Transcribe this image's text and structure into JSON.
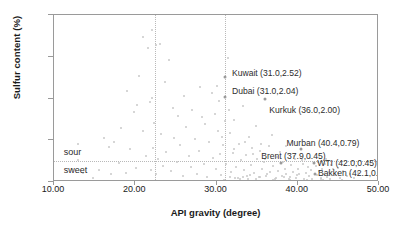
{
  "chart_data": {
    "type": "scatter",
    "title": "",
    "xlabel": "API gravity (degree)",
    "ylabel": "Sulfur content (%)",
    "xlim": [
      10.0,
      50.0
    ],
    "ylim": [
      0.0,
      4.0
    ],
    "xticks": [
      "10.00",
      "20.00",
      "30.00",
      "40.00",
      "50.00"
    ],
    "xtick_values": [
      10,
      20,
      30,
      40,
      50
    ],
    "yticks": [
      "0.00",
      "1.00",
      "2.00",
      "3.00",
      "4.00"
    ],
    "ytick_values": [
      0,
      1,
      2,
      3,
      4
    ],
    "grid": false,
    "legend": "none",
    "category_bands": [
      {
        "label": "heavy",
        "x_center": 25.0
      },
      {
        "label": "medium",
        "x_center": 31.1
      },
      {
        "label": "light",
        "x_center": 37.0
      }
    ],
    "vertical_dividers": [
      22.4,
      31.1
    ],
    "horizontal_divider": 0.5,
    "quality_labels": [
      {
        "label": "sour",
        "x": 11.2,
        "y": 0.72
      },
      {
        "label": "sweet",
        "x": 11.2,
        "y": 0.28
      }
    ],
    "annotations": [
      {
        "name": "Kuwait",
        "text": "Kuwait (31.0,2.52)",
        "x": 31.0,
        "y": 2.52,
        "label_x": 31.9,
        "label_y": 2.62
      },
      {
        "name": "Dubai",
        "text": "Dubai (31.0,2.04)",
        "x": 31.0,
        "y": 2.04,
        "label_x": 31.9,
        "label_y": 2.17
      },
      {
        "name": "Kurkuk",
        "text": "Kurkuk (36.0,2.00)",
        "x": 36.0,
        "y": 2.0,
        "label_x": 36.5,
        "label_y": 1.72
      },
      {
        "name": "Murban",
        "text": "Murban (40.4,0.79)",
        "x": 40.4,
        "y": 0.79,
        "label_x": 38.6,
        "label_y": 0.93
      },
      {
        "name": "Brent",
        "text": "Brent (37.9,0.45)",
        "x": 37.9,
        "y": 0.45,
        "label_x": 35.5,
        "label_y": 0.63
      },
      {
        "name": "WTI",
        "text": "WTI (42.0,0.45)",
        "x": 42.0,
        "y": 0.45,
        "label_x": 42.4,
        "label_y": 0.45
      },
      {
        "name": "Bakken",
        "text": "Bakken (42.1,0.18)",
        "x": 42.1,
        "y": 0.18,
        "label_x": 42.5,
        "label_y": 0.22
      }
    ],
    "points": [
      [
        12.9,
        0.92
      ],
      [
        13.6,
        0.21
      ],
      [
        14.8,
        0.1
      ],
      [
        16.2,
        1.05
      ],
      [
        16.8,
        0.84
      ],
      [
        17.4,
        0.95
      ],
      [
        18.0,
        0.45
      ],
      [
        18.3,
        1.3
      ],
      [
        18.9,
        0.22
      ],
      [
        19.3,
        0.78
      ],
      [
        19.8,
        1.68
      ],
      [
        20.1,
        0.33
      ],
      [
        20.5,
        2.55
      ],
      [
        20.9,
        1.22
      ],
      [
        21.0,
        3.48
      ],
      [
        21.3,
        0.63
      ],
      [
        21.6,
        3.22
      ],
      [
        21.8,
        1.92
      ],
      [
        21.9,
        0.28
      ],
      [
        22.0,
        2.02
      ],
      [
        22.1,
        3.64
      ],
      [
        22.2,
        0.82
      ],
      [
        22.3,
        1.41
      ],
      [
        22.5,
        3.28
      ],
      [
        22.6,
        0.18
      ],
      [
        22.8,
        0.55
      ],
      [
        23.0,
        3.3
      ],
      [
        23.2,
        1.15
      ],
      [
        23.4,
        0.38
      ],
      [
        23.8,
        0.72
      ],
      [
        24.1,
        2.92
      ],
      [
        24.4,
        0.27
      ],
      [
        24.8,
        1.05
      ],
      [
        25.1,
        0.48
      ],
      [
        25.5,
        0.88
      ],
      [
        25.9,
        0.15
      ],
      [
        26.2,
        1.32
      ],
      [
        26.6,
        0.62
      ],
      [
        26.9,
        0.35
      ],
      [
        27.3,
        1.02
      ],
      [
        27.6,
        0.2
      ],
      [
        27.9,
        0.74
      ],
      [
        28.2,
        1.55
      ],
      [
        28.5,
        0.42
      ],
      [
        28.8,
        0.12
      ],
      [
        29.1,
        0.95
      ],
      [
        29.4,
        2.12
      ],
      [
        29.6,
        0.58
      ],
      [
        29.9,
        0.3
      ],
      [
        30.2,
        1.22
      ],
      [
        30.4,
        0.68
      ],
      [
        30.6,
        0.16
      ],
      [
        30.8,
        0.88
      ],
      [
        31.2,
        0.44
      ],
      [
        31.4,
        2.98
      ],
      [
        31.6,
        1.18
      ],
      [
        31.8,
        0.25
      ],
      [
        32.0,
        0.7
      ],
      [
        32.2,
        1.48
      ],
      [
        32.4,
        0.35
      ],
      [
        32.6,
        0.09
      ],
      [
        32.8,
        0.92
      ],
      [
        33.0,
        0.52
      ],
      [
        33.2,
        1.82
      ],
      [
        33.4,
        0.28
      ],
      [
        33.6,
        0.64
      ],
      [
        33.8,
        0.14
      ],
      [
        34.0,
        1.08
      ],
      [
        34.2,
        0.4
      ],
      [
        34.4,
        0.82
      ],
      [
        34.6,
        0.22
      ],
      [
        34.8,
        1.35
      ],
      [
        35.0,
        0.56
      ],
      [
        35.2,
        0.11
      ],
      [
        35.4,
        0.74
      ],
      [
        35.6,
        0.32
      ],
      [
        35.8,
        0.48
      ],
      [
        36.2,
        0.18
      ],
      [
        36.4,
        0.86
      ],
      [
        36.6,
        0.24
      ],
      [
        36.8,
        1.12
      ],
      [
        37.0,
        0.38
      ],
      [
        37.2,
        0.08
      ],
      [
        37.4,
        0.6
      ],
      [
        37.6,
        0.26
      ],
      [
        38.0,
        0.15
      ],
      [
        38.2,
        0.48
      ],
      [
        38.4,
        0.32
      ],
      [
        38.6,
        0.2
      ],
      [
        38.8,
        0.66
      ],
      [
        39.0,
        0.12
      ],
      [
        39.2,
        0.4
      ],
      [
        39.4,
        0.25
      ],
      [
        39.6,
        0.55
      ],
      [
        39.8,
        0.1
      ],
      [
        40.0,
        0.3
      ],
      [
        40.2,
        0.18
      ],
      [
        40.6,
        0.44
      ],
      [
        40.8,
        0.08
      ],
      [
        41.0,
        0.22
      ],
      [
        41.2,
        0.35
      ],
      [
        41.4,
        0.14
      ],
      [
        41.6,
        0.28
      ],
      [
        41.8,
        0.06
      ],
      [
        42.2,
        0.38
      ],
      [
        42.4,
        0.16
      ],
      [
        42.6,
        0.26
      ],
      [
        42.8,
        0.1
      ],
      [
        43.0,
        0.32
      ],
      [
        43.2,
        0.2
      ],
      [
        43.4,
        0.44
      ],
      [
        43.6,
        0.12
      ],
      [
        43.8,
        0.24
      ],
      [
        44.0,
        0.08
      ],
      [
        44.3,
        0.3
      ],
      [
        44.6,
        0.16
      ],
      [
        44.9,
        0.22
      ],
      [
        45.2,
        0.1
      ],
      [
        45.6,
        0.26
      ],
      [
        46.0,
        0.14
      ],
      [
        46.4,
        0.18
      ],
      [
        46.9,
        0.09
      ],
      [
        47.4,
        0.21
      ],
      [
        30.0,
        2.3
      ],
      [
        30.3,
        1.95
      ],
      [
        29.8,
        1.62
      ],
      [
        31.0,
        1.45
      ],
      [
        31.5,
        1.72
      ],
      [
        30.7,
        1.08
      ],
      [
        32.1,
        0.78
      ],
      [
        33.5,
        0.96
      ],
      [
        34.5,
        0.68
      ],
      [
        35.5,
        0.92
      ],
      [
        36.0,
        0.55
      ],
      [
        37.8,
        0.72
      ],
      [
        38.5,
        0.86
      ],
      [
        39.5,
        0.62
      ],
      [
        40.5,
        0.52
      ],
      [
        41.5,
        0.58
      ],
      [
        42.5,
        0.48
      ],
      [
        43.5,
        0.55
      ],
      [
        19.0,
        2.18
      ],
      [
        20.2,
        1.85
      ],
      [
        23.6,
        2.4
      ],
      [
        24.6,
        1.78
      ],
      [
        25.3,
        1.58
      ],
      [
        26.0,
        2.05
      ],
      [
        27.0,
        1.72
      ],
      [
        28.0,
        2.28
      ],
      [
        28.6,
        1.38
      ],
      [
        12.2,
        0.32
      ],
      [
        13.0,
        0.52
      ],
      [
        15.5,
        0.28
      ],
      [
        17.0,
        0.18
      ],
      [
        44.1,
        0.4
      ],
      [
        45.0,
        0.34
      ],
      [
        33.9,
        0.06
      ],
      [
        36.9,
        0.05
      ],
      [
        39.1,
        0.04
      ],
      [
        41.1,
        0.05
      ],
      [
        43.1,
        0.04
      ],
      [
        45.4,
        0.05
      ],
      [
        30.9,
        0.05
      ],
      [
        32.9,
        0.07
      ],
      [
        34.9,
        0.06
      ],
      [
        38.9,
        0.06
      ],
      [
        40.9,
        0.03
      ],
      [
        42.9,
        0.07
      ],
      [
        31.7,
        0.12
      ],
      [
        32.3,
        0.09
      ],
      [
        33.3,
        0.11
      ],
      [
        35.3,
        0.13
      ],
      [
        37.3,
        0.1
      ],
      [
        38.3,
        0.12
      ],
      [
        34.1,
        0.16
      ],
      [
        36.1,
        0.14
      ],
      [
        39.9,
        0.17
      ]
    ]
  }
}
